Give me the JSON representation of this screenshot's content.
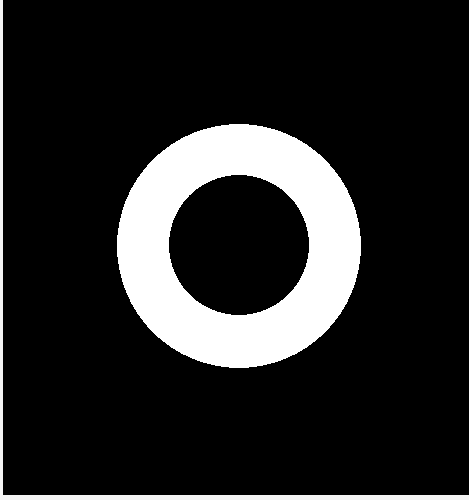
{
  "image": {
    "description": "White binary ring (annulus) on black background",
    "background_color": "#000000",
    "border_color": "#f4f4f4",
    "ring": {
      "color": "#ffffff",
      "center_x": 239,
      "center_y": 246,
      "outer_radius": 122,
      "inner_radius": 70,
      "hole_color": "#000000"
    }
  }
}
